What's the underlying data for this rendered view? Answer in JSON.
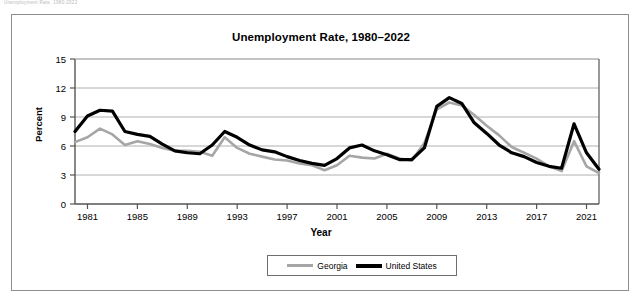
{
  "caption": {
    "faint_text": "Unemployment Rate, 1980-2022"
  },
  "chart_data": {
    "type": "line",
    "title": "Unemployment Rate, 1980–2022",
    "xlabel": "Year",
    "ylabel": "Percent",
    "xlim": [
      1980,
      2022
    ],
    "ylim": [
      0,
      15
    ],
    "yticks": [
      0,
      3,
      6,
      9,
      12,
      15
    ],
    "ytick_labels": [
      "0",
      "3",
      "6",
      "9",
      "12",
      "15"
    ],
    "xticks": [
      1981,
      1985,
      1989,
      1993,
      1997,
      2001,
      2005,
      2009,
      2013,
      2017,
      2021
    ],
    "xtick_labels": [
      "1981",
      "1985",
      "1989",
      "1993",
      "1997",
      "2001",
      "2005",
      "2009",
      "2013",
      "2017",
      "2021"
    ],
    "grid": "horizontal",
    "legend_position": "bottom",
    "x": [
      1980,
      1981,
      1982,
      1983,
      1984,
      1985,
      1986,
      1987,
      1988,
      1989,
      1990,
      1991,
      1992,
      1993,
      1994,
      1995,
      1996,
      1997,
      1998,
      1999,
      2000,
      2001,
      2002,
      2003,
      2004,
      2005,
      2006,
      2007,
      2008,
      2009,
      2010,
      2011,
      2012,
      2013,
      2014,
      2015,
      2016,
      2017,
      2018,
      2019,
      2020,
      2021,
      2022
    ],
    "series": [
      {
        "name": "Georgia",
        "color": "#a6a6a6",
        "line_width": 2.6,
        "values": [
          6.4,
          6.9,
          7.8,
          7.2,
          6.1,
          6.5,
          6.2,
          5.8,
          5.5,
          5.5,
          5.4,
          5.0,
          6.9,
          5.8,
          5.2,
          4.9,
          4.6,
          4.5,
          4.2,
          4.0,
          3.5,
          4.0,
          5.0,
          4.8,
          4.7,
          5.2,
          4.7,
          4.5,
          6.3,
          9.8,
          10.5,
          10.2,
          9.2,
          8.1,
          7.1,
          5.9,
          5.3,
          4.7,
          3.9,
          3.4,
          6.5,
          3.9,
          3.2
        ]
      },
      {
        "name": "United States",
        "color": "#000000",
        "line_width": 3.2,
        "values": [
          7.5,
          9.1,
          9.7,
          9.6,
          7.5,
          7.2,
          7.0,
          6.2,
          5.5,
          5.3,
          5.2,
          6.1,
          7.5,
          6.9,
          6.1,
          5.6,
          5.4,
          4.9,
          4.5,
          4.2,
          4.0,
          4.7,
          5.8,
          6.1,
          5.5,
          5.1,
          4.6,
          4.6,
          5.8,
          10.1,
          11.0,
          10.4,
          8.4,
          7.3,
          6.1,
          5.3,
          4.9,
          4.3,
          3.9,
          3.7,
          8.3,
          5.3,
          3.6
        ]
      }
    ]
  },
  "legend": {
    "items": [
      {
        "label": "Georgia"
      },
      {
        "label": "United States"
      }
    ]
  }
}
